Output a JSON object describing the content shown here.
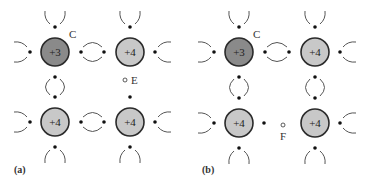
{
  "colors": {
    "acceptor_fill": "#8a8a8a",
    "host_fill": "#c8c8c8",
    "outline": "#2a2a2a",
    "electron": "#111111",
    "bond_arc": "#555555"
  },
  "panels": [
    {
      "id": "a",
      "label": "(a)",
      "label_pos": [
        14,
        173
      ],
      "atoms": [
        {
          "charge": "+3",
          "type": "acceptor",
          "cx": 55,
          "cy": 52
        },
        {
          "charge": "+4",
          "type": "host",
          "cx": 130,
          "cy": 52
        },
        {
          "charge": "+4",
          "type": "host",
          "cx": 55,
          "cy": 122
        },
        {
          "charge": "+4",
          "type": "host",
          "cx": 130,
          "cy": 122
        }
      ],
      "site_label": {
        "text": "C",
        "x": 69,
        "y": 38
      },
      "hole": {
        "text": "E",
        "cx": 125,
        "cy": 80,
        "lx": 131,
        "ly": 84
      },
      "broken_bond_electron": {
        "cx": 130,
        "cy": 97
      },
      "broken_bond": "right-vertical"
    },
    {
      "id": "b",
      "label": "(b)",
      "label_pos": [
        202,
        173
      ],
      "atoms": [
        {
          "charge": "+3",
          "type": "acceptor",
          "cx": 239,
          "cy": 52
        },
        {
          "charge": "+4",
          "type": "host",
          "cx": 315,
          "cy": 52
        },
        {
          "charge": "+4",
          "type": "host",
          "cx": 239,
          "cy": 123
        },
        {
          "charge": "+4",
          "type": "host",
          "cx": 315,
          "cy": 123
        }
      ],
      "site_label": {
        "text": "C",
        "x": 253,
        "y": 38
      },
      "hole": {
        "text": "F",
        "cx": 283,
        "cy": 125,
        "lx": 280,
        "ly": 140
      },
      "broken_bond_electron": {
        "cx": 264,
        "cy": 123
      },
      "broken_bond": "bottom-horizontal"
    }
  ]
}
